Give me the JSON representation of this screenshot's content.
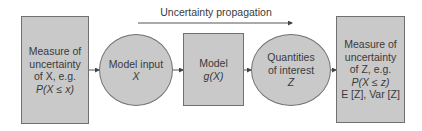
{
  "diagram": {
    "top_label": "Uncertainty propagation",
    "nodes": [
      {
        "id": "measure-x",
        "shape": "rectangle",
        "lines": [
          "Measure of",
          "uncertainty",
          "of X, e.g.",
          "P(X ≤ x)"
        ]
      },
      {
        "id": "model-input",
        "shape": "ellipse",
        "lines": [
          "Model input",
          "X"
        ]
      },
      {
        "id": "model",
        "shape": "rectangle",
        "lines": [
          "Model",
          "g(X)"
        ]
      },
      {
        "id": "quantities",
        "shape": "ellipse",
        "lines": [
          "Quantities",
          "of interest",
          "Z"
        ]
      },
      {
        "id": "measure-z",
        "shape": "rectangle",
        "lines": [
          "Measure of",
          "uncertainty",
          "of Z, e.g.",
          "P(X ≤ z)",
          "E [Z], Var [Z]"
        ]
      }
    ],
    "edges": [
      [
        "measure-x",
        "model-input"
      ],
      [
        "model-input",
        "model"
      ],
      [
        "model",
        "quantities"
      ],
      [
        "quantities",
        "measure-z"
      ]
    ],
    "colors": {
      "fill": "#c9c9c9",
      "stroke": "#707070",
      "text": "#3a3a3a"
    }
  }
}
